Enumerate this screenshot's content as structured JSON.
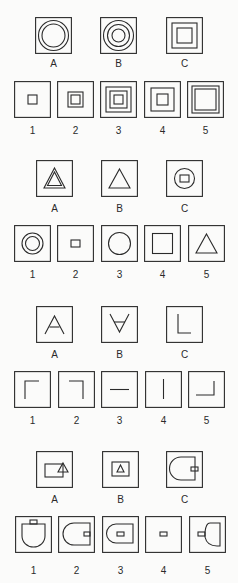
{
  "colors": {
    "background": "#fbfbfa",
    "stroke": "#2b2b2b",
    "text": "#2a2a2a"
  },
  "problems": [
    {
      "id": 1,
      "analogy": [
        {
          "label": "A",
          "figure": "square frame containing two concentric circles"
        },
        {
          "label": "B",
          "figure": "square frame containing three concentric circles"
        },
        {
          "label": "C",
          "figure": "square frame containing two concentric squares"
        }
      ],
      "options": [
        {
          "label": "1",
          "figure": "one small square"
        },
        {
          "label": "2",
          "figure": "two concentric squares (small)"
        },
        {
          "label": "3",
          "figure": "three concentric squares"
        },
        {
          "label": "4",
          "figure": "two concentric squares (medium)"
        },
        {
          "label": "5",
          "figure": "two concentric squares (large)"
        }
      ]
    },
    {
      "id": 2,
      "analogy": [
        {
          "label": "A",
          "figure": "double triangle (triangle within triangle)"
        },
        {
          "label": "B",
          "figure": "single triangle"
        },
        {
          "label": "C",
          "figure": "circle containing small square"
        }
      ],
      "options": [
        {
          "label": "1",
          "figure": "two concentric circles"
        },
        {
          "label": "2",
          "figure": "small square"
        },
        {
          "label": "3",
          "figure": "circle"
        },
        {
          "label": "4",
          "figure": "square"
        },
        {
          "label": "5",
          "figure": "triangle"
        }
      ]
    },
    {
      "id": 3,
      "analogy": [
        {
          "label": "A",
          "figure": "inverted V (A shape)"
        },
        {
          "label": "B",
          "figure": "V shape with crossbar"
        },
        {
          "label": "C",
          "figure": "L shape"
        }
      ],
      "options": [
        {
          "label": "1",
          "figure": "corner top-left"
        },
        {
          "label": "2",
          "figure": "corner top-right"
        },
        {
          "label": "3",
          "figure": "horizontal line"
        },
        {
          "label": "4",
          "figure": "vertical line"
        },
        {
          "label": "5",
          "figure": "corner bottom-right"
        }
      ]
    },
    {
      "id": 4,
      "analogy": [
        {
          "label": "A",
          "figure": "rectangle with triangle overlapping right edge"
        },
        {
          "label": "B",
          "figure": "rectangle with triangle inside"
        },
        {
          "label": "C",
          "figure": "D shape (rounded left) with small rectangle overlapping right edge"
        }
      ],
      "options": [
        {
          "label": "1",
          "figure": "D shape rotated, rounded bottom, tab on top"
        },
        {
          "label": "2",
          "figure": "D shape with small rectangle attached inside right edge"
        },
        {
          "label": "3",
          "figure": "D shape with small rectangle inside"
        },
        {
          "label": "4",
          "figure": "small rectangle only"
        },
        {
          "label": "5",
          "figure": "bell shape with small rectangle on left"
        }
      ]
    }
  ]
}
